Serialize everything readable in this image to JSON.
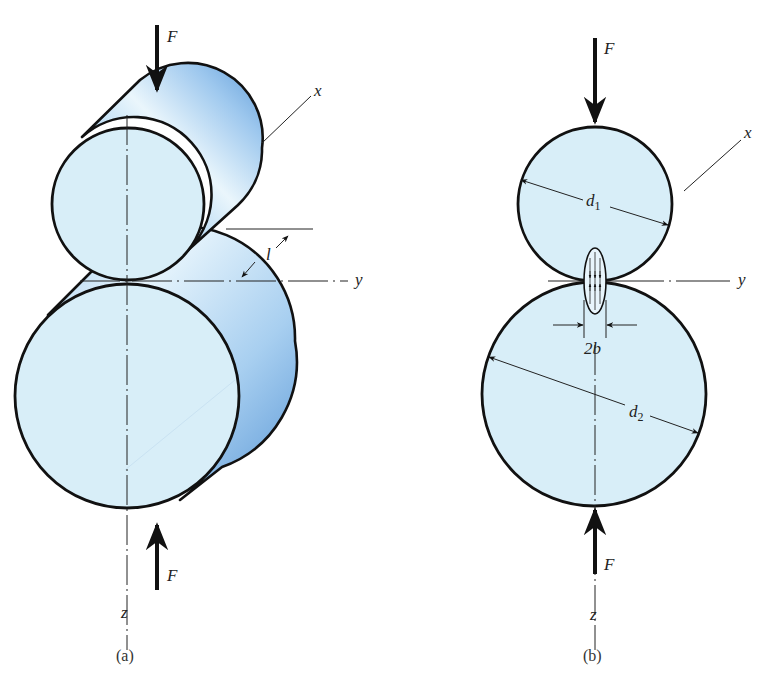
{
  "figure": {
    "colors": {
      "face_fill": "#d8eef8",
      "side_light": "#e6f3fb",
      "side_dark": "#5e9bd8",
      "outline": "#111111",
      "axis_line": "#222222"
    },
    "panels": [
      {
        "id": "a",
        "caption": "(a)",
        "view": "isometric",
        "labels": {
          "force_top": "F",
          "force_bottom": "F",
          "axis_x": "x",
          "axis_y": "y",
          "axis_z": "z",
          "length": "l"
        }
      },
      {
        "id": "b",
        "caption": "(b)",
        "view": "end",
        "labels": {
          "force_top": "F",
          "force_bottom": "F",
          "axis_x": "x",
          "axis_y": "y",
          "axis_z": "z",
          "diameter_1": "d",
          "diameter_1_sub": "1",
          "diameter_2": "d",
          "diameter_2_sub": "2",
          "contact_width": "2b"
        }
      }
    ]
  }
}
